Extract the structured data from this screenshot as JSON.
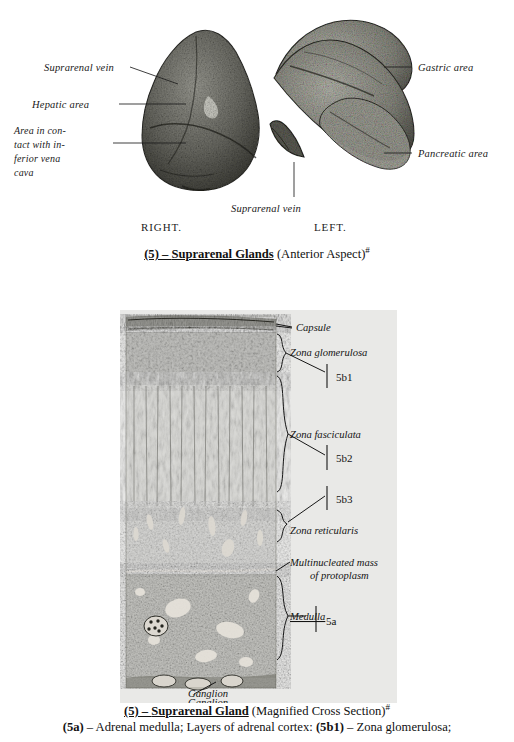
{
  "figure_gross": {
    "name": "suprarenal-glands-anterior",
    "labels_left": [
      "Suprarenal vein",
      "Hepatic area",
      "Area in con-",
      "tact with in-",
      "ferior  vena",
      "cava"
    ],
    "labels_right": [
      "Gastric area",
      "Pancreatic area"
    ],
    "label_bottom": "Suprarenal vein",
    "side_right": "RIGHT.",
    "side_left": "LEFT."
  },
  "caption_gross": {
    "number": "(5) – ",
    "title": "Suprarenal Glands",
    "aspect": " (Anterior Aspect)",
    "marker": "#"
  },
  "figure_histology": {
    "name": "suprarenal-gland-cross-section",
    "labels": [
      "Capsule",
      "Zona glomerulosa",
      "Zona fasciculata",
      "Zona reticularis",
      "Multinucleated mass",
      "of protoplasm",
      "Medulla",
      "Ganglion"
    ],
    "keys": [
      "5b1",
      "5b2",
      "5b3",
      "5a"
    ]
  },
  "caption_histology": {
    "number": "(5) – ",
    "title": "Suprarenal Gland",
    "aspect": " (Magnified Cross Section)",
    "marker": "#"
  },
  "caption_legend": {
    "key_a": "(5a)",
    "text_a": " – Adrenal medulla; Layers of adrenal cortex:  ",
    "key_b1": "(5b1)",
    "text_b1": " – Zona glomerulosa;"
  },
  "colors": {
    "page_background": "#ffffff",
    "panel_background": "#e9e9e7",
    "ink": "#1a1a1a",
    "tissue_dark": "#6e6e68",
    "tissue_mid": "#8d8d86",
    "tissue_light": "#b6b6ae"
  }
}
